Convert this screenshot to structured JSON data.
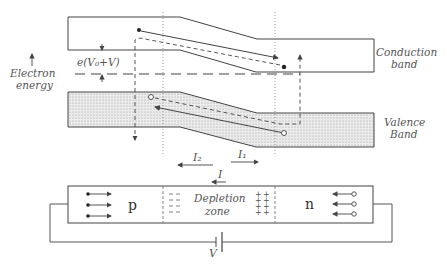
{
  "labels": {
    "conduction_band": [
      "Conduction",
      "band"
    ],
    "valence_band": [
      "Valence",
      "Band"
    ],
    "electron_energy": [
      "Electron",
      "energy"
    ],
    "barrier": "e(V₀+V)",
    "current_2": "I₂",
    "current_1": "I₁",
    "current_total": "I",
    "p_region": "p",
    "n_region": "n",
    "depletion_zone": [
      "Depletion",
      "zone"
    ],
    "battery": "V"
  },
  "colors": {
    "line": "#444444",
    "text": "#555555",
    "band_fill": "#e3e3e3"
  }
}
